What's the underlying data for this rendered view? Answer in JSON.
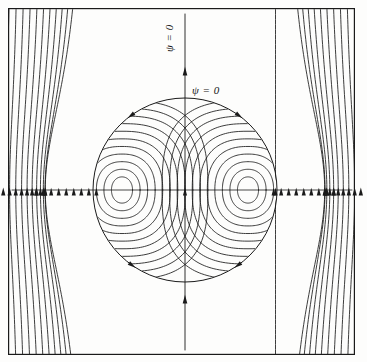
{
  "figure": {
    "background_color": "#fdfdfc",
    "line_color": "#1a1a1a",
    "frame": {
      "x": 8,
      "y": 8,
      "width": 347,
      "height": 347,
      "stroke_width": 1.2
    }
  },
  "labels": {
    "vertical": "ψ = 0",
    "horizontal": "ψ = 0"
  },
  "chart_data": {
    "type": "line",
    "subtype": "streamline-contour",
    "xlabel": "",
    "ylabel": "",
    "grid": false,
    "legend": null,
    "annotations": [
      {
        "text": "ψ = 0",
        "x": 168,
        "y": 70,
        "rotation": -90,
        "refers_to": "vertical-centerline-separatrix"
      },
      {
        "text": "ψ = 0",
        "x": 192,
        "y": 84,
        "rotation": 0,
        "refers_to": "circular-separatrix"
      }
    ],
    "separatrix": {
      "circle": {
        "cx": 185,
        "cy": 190,
        "r": 92
      },
      "axis_vertical": {
        "x": 185,
        "y0": 14,
        "y1": 350
      },
      "axis_horizontal": {
        "y": 190,
        "x0": 12,
        "x1": 352
      }
    },
    "vortex_centers": [
      {
        "label": "left-cell-center",
        "x": 122,
        "y": 190,
        "rotation": "clockwise"
      },
      {
        "label": "right-cell-center",
        "x": 248,
        "y": 190,
        "rotation": "counter-clockwise"
      }
    ],
    "inner_streamline_count": 11,
    "outer_streamline_count": 46,
    "arrow_count_midline": 40,
    "arrow_count_circle": 4,
    "arrow_count_axis": 2,
    "flow_direction": "upward (+y) far field",
    "xlim": [
      8,
      355
    ],
    "ylim": [
      8,
      355
    ]
  }
}
